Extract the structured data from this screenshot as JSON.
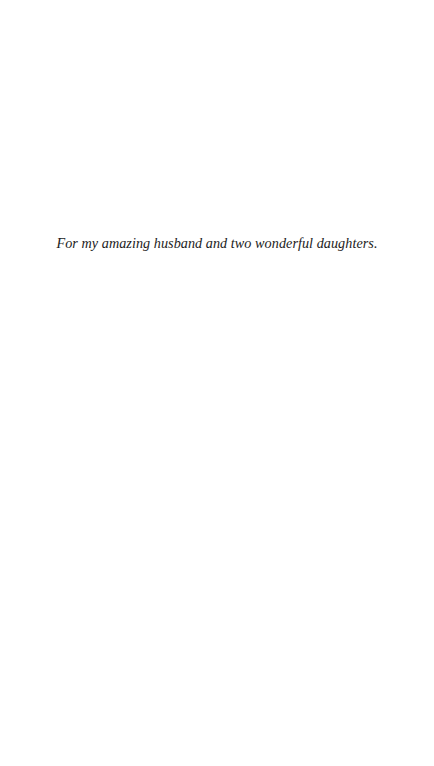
{
  "page": {
    "dedication": "For my amazing husband and two wonderful daughters."
  }
}
